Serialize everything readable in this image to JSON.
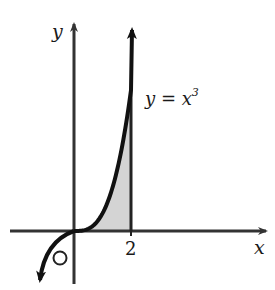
{
  "figure": {
    "title": "",
    "axes": {
      "x_label": "x",
      "y_label": "y",
      "origin_label": "O",
      "x_tick_labels": [
        "2"
      ]
    },
    "curve": {
      "equation_lhs": "y = x",
      "equation_exponent": "3",
      "function": "x^3"
    },
    "shaded_region": {
      "description": "area under y = x^3 from x = 0 to x = 2",
      "x_from": 0,
      "x_to": 2,
      "fill_color": "#d4d4d4"
    },
    "colors": {
      "line": "#1a1a1a",
      "axis": "#333333",
      "background": "#ffffff"
    }
  },
  "chart_data": {
    "type": "line",
    "title": "",
    "xlabel": "x",
    "ylabel": "y",
    "series": [
      {
        "name": "y = x^3",
        "x": [
          -1.2,
          -1.0,
          -0.8,
          -0.5,
          0,
          0.5,
          1.0,
          1.5,
          2.0
        ],
        "y": [
          -1.728,
          -1.0,
          -0.512,
          -0.125,
          0,
          0.125,
          1.0,
          3.375,
          8.0
        ]
      }
    ],
    "annotations": [
      "y = x^3",
      "2",
      "O"
    ],
    "shaded_interval": [
      0,
      2
    ],
    "grid": false
  }
}
